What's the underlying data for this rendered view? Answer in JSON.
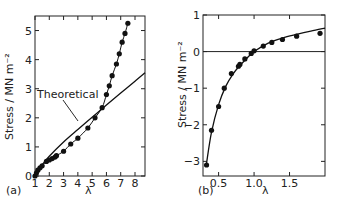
{
  "chart_data": [
    {
      "panel": "(a)",
      "type": "line",
      "title": "",
      "xlabel": "λ",
      "ylabel": "Stress / MN m⁻²",
      "xlim": [
        1,
        8.7
      ],
      "ylim": [
        0,
        5.5
      ],
      "xticks": [
        1,
        2,
        3,
        4,
        5,
        6,
        7,
        8
      ],
      "yticks": [
        0,
        1,
        2,
        3,
        4,
        5
      ],
      "grid": false,
      "annotation": "Theoretical",
      "series": [
        {
          "name": "Experimental",
          "style": "points+curve",
          "x": [
            1.0,
            1.1,
            1.2,
            1.35,
            1.5,
            1.8,
            2.0,
            2.2,
            2.4,
            2.5,
            3.0,
            3.5,
            4.0,
            4.7,
            5.2,
            5.7,
            6.0,
            6.2,
            6.4,
            6.7,
            6.9,
            7.1,
            7.3,
            7.5
          ],
          "y": [
            0.0,
            0.1,
            0.2,
            0.28,
            0.35,
            0.5,
            0.55,
            0.6,
            0.65,
            0.7,
            0.85,
            1.1,
            1.3,
            1.65,
            2.0,
            2.35,
            2.8,
            3.1,
            3.45,
            3.85,
            4.2,
            4.6,
            4.9,
            5.25
          ]
        },
        {
          "name": "Theoretical",
          "style": "curve",
          "x": [
            1.0,
            1.5,
            2.0,
            3.0,
            4.0,
            5.0,
            6.0,
            7.0,
            8.0,
            8.7
          ],
          "y": [
            0.0,
            0.38,
            0.68,
            1.17,
            1.6,
            2.02,
            2.44,
            2.85,
            3.26,
            3.55
          ]
        }
      ]
    },
    {
      "panel": "(b)",
      "type": "line",
      "title": "",
      "xlabel": "λ",
      "ylabel": "Stress / MN m⁻²",
      "xlim": [
        0.28,
        2.0
      ],
      "ylim": [
        -3.4,
        1.0
      ],
      "xticks": [
        0.5,
        1.0,
        1.5
      ],
      "yticks": [
        -3,
        -2,
        -1,
        0,
        1
      ],
      "grid": false,
      "zero_line": true,
      "series": [
        {
          "name": "Experimental",
          "style": "points",
          "x": [
            0.33,
            0.4,
            0.5,
            0.58,
            0.68,
            0.78,
            0.8,
            0.87,
            0.96,
            1.0,
            1.13,
            1.25,
            1.4,
            1.6,
            1.93
          ],
          "y": [
            -3.1,
            -2.15,
            -1.5,
            -1.0,
            -0.6,
            -0.4,
            -0.35,
            -0.2,
            -0.05,
            0.02,
            0.15,
            0.25,
            0.33,
            0.42,
            0.5
          ]
        },
        {
          "name": "Theoretical",
          "style": "curve",
          "x": [
            0.33,
            0.4,
            0.5,
            0.6,
            0.7,
            0.8,
            0.9,
            1.0,
            1.2,
            1.4,
            1.6,
            1.8,
            2.0
          ],
          "y": [
            -3.05,
            -2.2,
            -1.45,
            -0.95,
            -0.62,
            -0.38,
            -0.18,
            0.0,
            0.23,
            0.37,
            0.47,
            0.56,
            0.64
          ]
        }
      ]
    }
  ],
  "panels": {
    "a": {
      "label": "(a)",
      "xlabel": "λ",
      "ylabel": "Stress / MN m⁻²",
      "annotation": "Theoretical",
      "xtick_labels": [
        "1",
        "2",
        "3",
        "4",
        "5",
        "6",
        "7",
        "8"
      ],
      "ytick_labels": [
        "0",
        "1",
        "2",
        "3",
        "4",
        "5"
      ]
    },
    "b": {
      "label": "(b)",
      "xlabel": "λ",
      "ylabel": "Stress / MN m⁻²",
      "xtick_labels": [
        "0.5",
        "1.0",
        "1.5"
      ],
      "ytick_labels": [
        "1",
        "0",
        "−1",
        "−2",
        "−3"
      ]
    }
  }
}
